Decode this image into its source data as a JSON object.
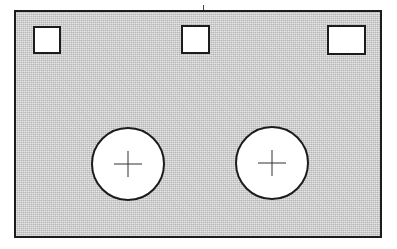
{
  "drawing": {
    "title": "Rectangular plate with square cut-outs and circular holes",
    "type": "engineering-part-drawing",
    "view": "front-elevation",
    "background_color": "#ffffff",
    "line_color": "#1c1c1c",
    "hatch_color": "#cbcbcb",
    "cutout_fill_color": "#ffffff",
    "center_mark_color": "#303030"
  },
  "canvas": {
    "width": 397,
    "height": 249,
    "units": "px"
  },
  "plate": {
    "label": "plate-outline",
    "x": 14,
    "y": 10,
    "width": 368,
    "height": 228,
    "stroke_width": 2,
    "fill": "hatched-gray"
  },
  "tick": {
    "label": "top-registration-tick",
    "x": 203,
    "y": 5,
    "width": 1,
    "height": 6
  },
  "squares": [
    {
      "label": "square-cutout-left",
      "x": 33,
      "y": 26,
      "width": 28,
      "height": 28
    },
    {
      "label": "square-cutout-center",
      "x": 181,
      "y": 25,
      "width": 29,
      "height": 29
    },
    {
      "label": "square-cutout-right",
      "x": 327,
      "y": 25,
      "width": 39,
      "height": 30
    }
  ],
  "circles": [
    {
      "label": "circular-hole-left",
      "cx": 128,
      "cy": 164,
      "r": 37,
      "center_mark": {
        "label": "center-mark-left",
        "width": 28,
        "height": 26
      }
    },
    {
      "label": "circular-hole-right",
      "cx": 272,
      "cy": 163,
      "r": 37,
      "center_mark": {
        "label": "center-mark-right",
        "width": 28,
        "height": 26
      }
    }
  ]
}
